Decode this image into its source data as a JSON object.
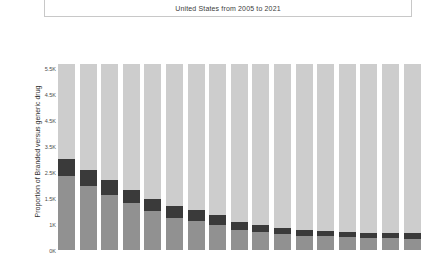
{
  "title": {
    "text": "United States from 2005 to 2021"
  },
  "axes": {
    "y_axis_title": "Proportion of Branded versus generic drug",
    "y_tick_labels": [
      "5.5K",
      "4.5K",
      "4.5K",
      "3.5K",
      "2.5K",
      "1.5K",
      "1K",
      "0K"
    ]
  },
  "colors": {
    "generic": "#cdcdcd",
    "branded": "#3a3a3a",
    "other": "#919191",
    "title_border": "#c8c8c8",
    "text": "#3c3c3c",
    "background": "#ffffff"
  },
  "chart_data": {
    "type": "bar",
    "title": "United States from 2005 to 2021",
    "xlabel": "",
    "ylabel": "Proportion of Branded versus generic drug",
    "ylim": [
      0,
      5500
    ],
    "grid": false,
    "legend_position": "none",
    "stacked": true,
    "categories": [
      "2005",
      "2006",
      "2007",
      "2008",
      "2009",
      "2010",
      "2011",
      "2012",
      "2013",
      "2014",
      "2015",
      "2016",
      "2017",
      "2018",
      "2019",
      "2020",
      "2021"
    ],
    "series": [
      {
        "name": "other",
        "color": "#919191",
        "values": [
          2180,
          1900,
          1620,
          1380,
          1140,
          960,
          860,
          740,
          600,
          520,
          460,
          420,
          400,
          380,
          360,
          350,
          340
        ]
      },
      {
        "name": "branded",
        "color": "#3a3a3a",
        "values": [
          520,
          480,
          440,
          400,
          380,
          340,
          320,
          300,
          240,
          220,
          200,
          180,
          170,
          160,
          150,
          150,
          150
        ]
      },
      {
        "name": "generic",
        "color": "#cdcdcd",
        "values": [
          2800,
          3120,
          3440,
          3720,
          3980,
          4200,
          4320,
          4460,
          4660,
          4760,
          4840,
          4900,
          4930,
          4960,
          4990,
          5000,
          5010
        ]
      }
    ],
    "total": 5500
  }
}
